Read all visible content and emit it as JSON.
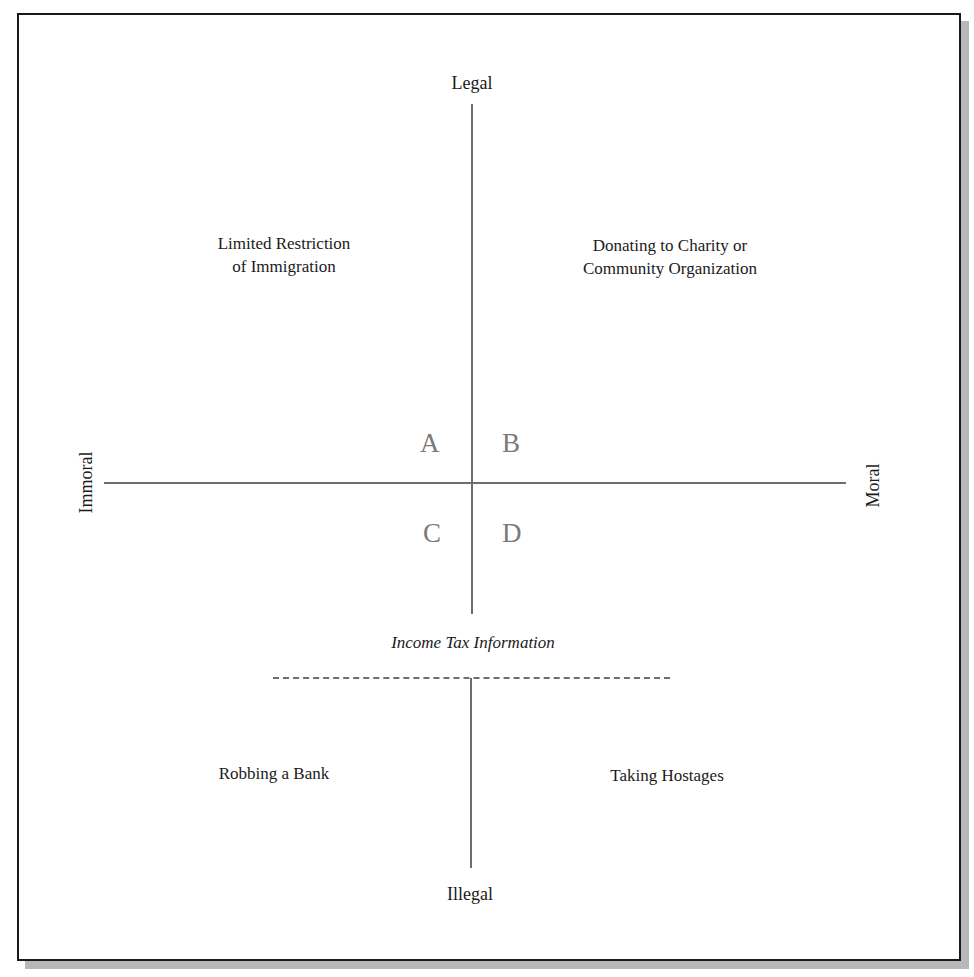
{
  "diagram": {
    "axes": {
      "top": "Legal",
      "bottom": "Illegal",
      "left": "Immoral",
      "right": "Moral"
    },
    "quadrants": {
      "A": "A",
      "B": "B",
      "C": "C",
      "D": "D"
    },
    "examples": {
      "top_left": {
        "line1": "Limited Restriction",
        "line2": "of Immigration"
      },
      "top_right": {
        "line1": "Donating to Charity or",
        "line2": "Community Organization"
      },
      "bottom_left": "Robbing a Bank",
      "bottom_right": "Taking Hostages",
      "middle": "Income Tax Information"
    },
    "colors": {
      "axis_line": "#6e6e6e",
      "quadrant_letter": "#7a7a7a",
      "frame_border": "#1a1a1a",
      "frame_shadow": "#b8b8b8",
      "text": "#1a1a1a"
    }
  }
}
